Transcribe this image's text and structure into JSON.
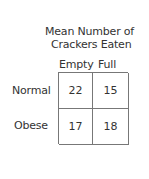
{
  "chart_data": {
    "type": "table",
    "title_lines": [
      "Mean Number of",
      "Crackers Eaten"
    ],
    "columns": [
      "Empty",
      "Full"
    ],
    "rows": [
      "Normal",
      "Obese"
    ],
    "values": [
      [
        22,
        15
      ],
      [
        17,
        18
      ]
    ],
    "cells": {
      "normal_empty": "22",
      "normal_full": "15",
      "obese_empty": "17",
      "obese_full": "18"
    }
  }
}
